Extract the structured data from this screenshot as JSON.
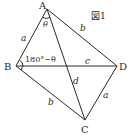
{
  "figure": {
    "title": "図1",
    "vertices": {
      "A": {
        "label": "A",
        "x": 47,
        "y": 9
      },
      "B": {
        "label": "B",
        "x": 16,
        "y": 66
      },
      "C": {
        "label": "C",
        "x": 85,
        "y": 120
      },
      "D": {
        "label": "D",
        "x": 117,
        "y": 66
      }
    },
    "edges": {
      "AB": "a",
      "AD": "b",
      "BC": "b",
      "CD": "a",
      "BD": "c",
      "AC": "d"
    },
    "angles": {
      "A": "θ",
      "B": "180°−θ"
    },
    "colors": {
      "stroke": "#2a2a2a",
      "background": "#ffffff"
    }
  }
}
